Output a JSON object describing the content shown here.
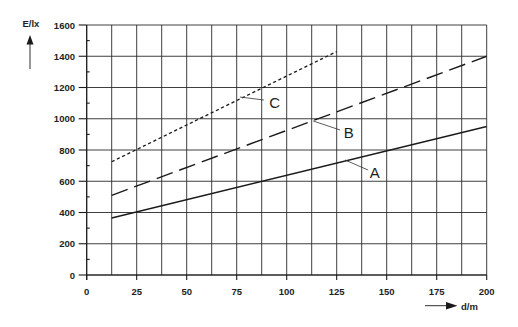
{
  "chart_data": {
    "type": "line",
    "title": "",
    "xlabel": "d/m",
    "ylabel": "E/lx",
    "xlim": [
      0,
      200
    ],
    "ylim": [
      0,
      1600
    ],
    "x_ticks": [
      0,
      25,
      50,
      75,
      100,
      125,
      150,
      175,
      200
    ],
    "y_ticks": [
      0,
      200,
      400,
      600,
      800,
      1000,
      1200,
      1400,
      1600
    ],
    "x_grid_step": 12.5,
    "y_grid_step": 200,
    "y_minor_tick_step": 100,
    "grid": true,
    "legend": "none (direct labels A, B, C with leader lines)",
    "series": [
      {
        "name": "A",
        "style": "solid",
        "color": "#1a1a1a",
        "x": [
          12.5,
          200
        ],
        "y": [
          365,
          950
        ]
      },
      {
        "name": "B",
        "style": "dashed",
        "color": "#1a1a1a",
        "x": [
          12.5,
          200
        ],
        "y": [
          510,
          1400
        ]
      },
      {
        "name": "C",
        "style": "dotted",
        "color": "#1a1a1a",
        "x": [
          12.5,
          125
        ],
        "y": [
          725,
          1430
        ]
      }
    ],
    "annotations": [
      {
        "text": "C",
        "label_at": [
          94,
          1107
        ],
        "leader_from": [
          76.6,
          1139
        ],
        "leader_to": [
          88.6,
          1120
        ]
      },
      {
        "text": "B",
        "label_at": [
          131,
          909
        ],
        "leader_from": [
          113.2,
          986
        ],
        "leader_to": [
          126.7,
          928
        ]
      },
      {
        "text": "A",
        "label_at": [
          144,
          659
        ],
        "leader_from": [
          129.2,
          736
        ],
        "leader_to": [
          140.7,
          672
        ]
      }
    ]
  },
  "axes": {
    "y_title": "E/lx",
    "x_title": "d/m",
    "y_arrow_icon": "arrow-up-icon",
    "x_arrow_icon": "arrow-right-icon"
  }
}
